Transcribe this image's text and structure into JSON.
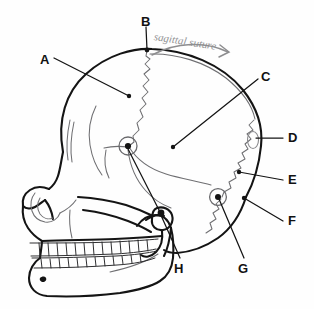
{
  "figure": {
    "background_color": "#fefefe",
    "ink_color": "#111111",
    "faint_ink_color": "#9b9b9d",
    "pencil_color": "#8d8d8f"
  },
  "annotation": {
    "handwritten_text": "sagittal suture",
    "arrow": "curved-arrow-right",
    "color": "#8d8d8f"
  },
  "labels": [
    {
      "id": "A",
      "text": "A",
      "x": 40,
      "y": 53,
      "points_to": "coronal-suture"
    },
    {
      "id": "B",
      "text": "B",
      "x": 141,
      "y": 17,
      "points_to": "bregma"
    },
    {
      "id": "C",
      "text": "C",
      "x": 261,
      "y": 70,
      "points_to": "parietal-bone"
    },
    {
      "id": "D",
      "text": "D",
      "x": 287,
      "y": 133,
      "points_to": "occipital-bone"
    },
    {
      "id": "E",
      "text": "E",
      "x": 287,
      "y": 174,
      "points_to": "lambdoid-suture"
    },
    {
      "id": "F",
      "text": "F",
      "x": 287,
      "y": 215,
      "points_to": "external-occipital-protuberance"
    },
    {
      "id": "G",
      "text": "G",
      "x": 238,
      "y": 263,
      "points_to": "asterion"
    },
    {
      "id": "H",
      "text": "H",
      "x": 174,
      "y": 263,
      "points_to": "external-acoustic-meatus"
    }
  ],
  "markers": [
    {
      "id": "pterion-marker",
      "x": 128,
      "y": 146,
      "r": 9
    },
    {
      "id": "asterion-marker",
      "x": 218,
      "y": 197,
      "r": 8
    }
  ],
  "leader_lines": [
    {
      "from": "A",
      "to": "coronal-suture"
    },
    {
      "from": "B",
      "to": "bregma"
    },
    {
      "from": "C",
      "to": "parietal-bone"
    },
    {
      "from": "D",
      "to": "occipital-bone"
    },
    {
      "from": "E",
      "to": "lambdoid-suture"
    },
    {
      "from": "F",
      "to": "external-occipital-protuberance"
    },
    {
      "from": "G",
      "to": "asterion-marker"
    },
    {
      "from": "H",
      "to": "external-acoustic-meatus"
    }
  ]
}
